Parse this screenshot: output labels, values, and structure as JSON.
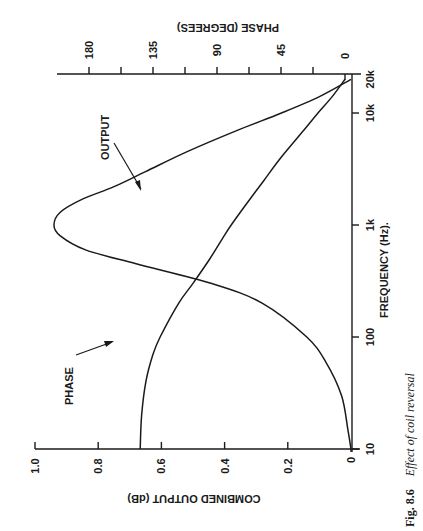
{
  "figure": {
    "number": "Fig. 8.6",
    "caption": "Effect of coil reversal",
    "orientation": "rotated 90° counter-clockwise on the page"
  },
  "chart_data": {
    "type": "line",
    "title": "Effect of coil reversal",
    "xlabel": "FREQUENCY (Hz).",
    "ylabel": "COMBINED OUTPUT (dB)",
    "y2label": "PHASE (DEGREES)",
    "xscale": "log",
    "xlim": [
      10,
      20000
    ],
    "ylim": [
      0,
      1.0
    ],
    "y2lim": [
      0,
      180
    ],
    "x_ticks": [
      "10",
      "100",
      "1k",
      "10k",
      "20k"
    ],
    "x_tick_values": [
      10,
      100,
      1000,
      10000,
      20000
    ],
    "y_ticks": [
      "0",
      "0.2",
      "0.4",
      "0.6",
      "0.8",
      "1.0"
    ],
    "y2_ticks": [
      "0",
      "45",
      "90",
      "135",
      "180"
    ],
    "grid": false,
    "annotations": [
      {
        "text": "OUTPUT",
        "points_to": "output curve near 2.5 kHz"
      },
      {
        "text": "PHASE",
        "points_to": "phase curve near 70 Hz"
      }
    ],
    "series": [
      {
        "name": "OUTPUT",
        "axis": "dB",
        "x": [
          10,
          15,
          30,
          60,
          100,
          200,
          300,
          450,
          600,
          800,
          1000,
          1300,
          1700,
          2200,
          3000,
          4500,
          7000,
          10000,
          14000,
          20000
        ],
        "values": [
          0.0,
          0.01,
          0.03,
          0.08,
          0.14,
          0.28,
          0.44,
          0.68,
          0.84,
          0.92,
          0.94,
          0.92,
          0.85,
          0.75,
          0.65,
          0.52,
          0.36,
          0.22,
          0.1,
          0.0
        ]
      },
      {
        "name": "PHASE",
        "axis": "degrees",
        "x": [
          10,
          20,
          40,
          70,
          100,
          200,
          300,
          500,
          800,
          1000,
          1500,
          2500,
          4000,
          7000,
          10000,
          14000,
          20000
        ],
        "values": [
          144,
          143,
          140,
          135,
          130,
          117,
          107,
          95,
          85,
          80,
          70,
          57,
          45,
          29,
          19,
          9,
          0
        ]
      }
    ]
  },
  "labels": {
    "output": "OUTPUT",
    "phase": "PHASE",
    "xlabel": "FREQUENCY (Hz).",
    "ylabel": "COMBINED OUTPUT (dB)",
    "y2label": "PHASE (DEGREES)"
  }
}
